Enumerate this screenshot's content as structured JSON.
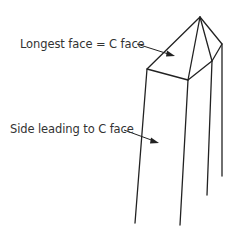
{
  "diagram": {
    "type": "crystal-point-sketch",
    "labels": {
      "c_face": "Longest face = C face",
      "side": "Side leading to C face"
    },
    "colors": {
      "line": "#222222",
      "text": "#333333",
      "background": "#ffffff"
    }
  }
}
